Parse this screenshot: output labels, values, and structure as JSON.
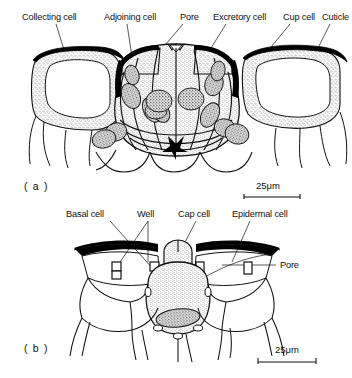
{
  "figure": {
    "type": "scientific-line-drawing",
    "background_color": "#ffffff",
    "ink_color": "#111111",
    "wall_fill_color": "#b8b8b8",
    "cytoplasm_stipple_color": "#9a9a9a",
    "nucleus_stipple_color": "#4a4a4a",
    "cuticle_color": "#000000"
  },
  "panel_a": {
    "id": "( a )",
    "labels": [
      {
        "text": "Collecting cell",
        "x": 22,
        "y": 20
      },
      {
        "text": "Adjoining cell",
        "x": 104,
        "y": 20
      },
      {
        "text": "Pore",
        "x": 180,
        "y": 20
      },
      {
        "text": "Excretory cell",
        "x": 213,
        "y": 20
      },
      {
        "text": "Cup cell",
        "x": 283,
        "y": 20
      },
      {
        "text": "Cuticle",
        "x": 322,
        "y": 20
      }
    ],
    "scale_bar": {
      "text": "25μm",
      "value": 25,
      "unit": "μm"
    }
  },
  "panel_b": {
    "id": "( b )",
    "labels": [
      {
        "text": "Basal cell",
        "x": 66,
        "y": 217
      },
      {
        "text": "Well",
        "x": 137,
        "y": 217
      },
      {
        "text": "Cap cell",
        "x": 178,
        "y": 217
      },
      {
        "text": "Epidermal cell",
        "x": 232,
        "y": 217
      },
      {
        "text": "Pore",
        "x": 280,
        "y": 265
      }
    ],
    "scale_bar": {
      "text": "25μm",
      "value": 25,
      "unit": "μm"
    }
  }
}
